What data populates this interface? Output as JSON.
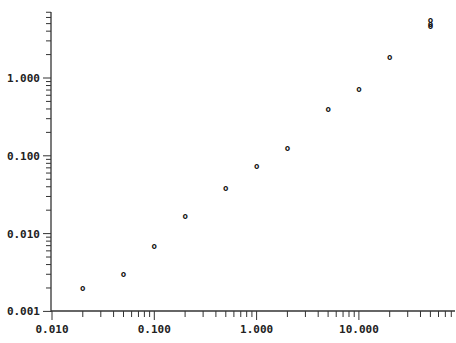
{
  "chart_data": {
    "type": "scatter",
    "title": "",
    "xlabel": "",
    "ylabel": "",
    "xscale": "log",
    "yscale": "log",
    "xlim": [
      0.01,
      100
    ],
    "ylim": [
      0.001,
      7
    ],
    "grid": false,
    "legend": null,
    "marker": "o",
    "x_tick_labels": [
      "0.010",
      "0.100",
      "1.000",
      "10.000"
    ],
    "x_ticks": [
      0.01,
      0.1,
      1,
      10
    ],
    "y_tick_labels": [
      "0.001",
      "0.010",
      "0.100",
      "1.000"
    ],
    "y_ticks": [
      0.001,
      0.01,
      0.1,
      1
    ],
    "series": [
      {
        "name": "data",
        "x": [
          0.02,
          0.05,
          0.1,
          0.2,
          0.5,
          1.0,
          2.0,
          5.0,
          10.0,
          20.0,
          50.0,
          50.0,
          50.0
        ],
        "y": [
          0.002,
          0.003,
          0.007,
          0.017,
          0.039,
          0.074,
          0.127,
          0.4,
          0.72,
          1.86,
          4.6,
          5.0,
          5.5
        ]
      }
    ]
  },
  "axes": {
    "x_labels": [
      "0.010",
      "0.100",
      "1.000",
      "10.000"
    ],
    "y_labels": [
      "0.001",
      "0.010",
      "0.100",
      "1.000"
    ]
  },
  "marker_glyph": "o"
}
